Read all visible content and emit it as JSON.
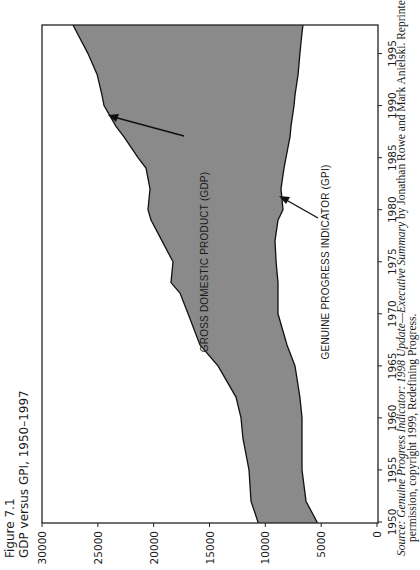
{
  "figure": {
    "number_label": "Figure 7.1",
    "title": "GDP versus GPI, 1950–1997"
  },
  "caption": {
    "line1_prefix": "Source: ",
    "line1_title": "Genuine Progress Indicator: 1998 Update—Executive Summary",
    "line1_rest": " by Jonathan Rowe and Mark Anielski. Reprinted with",
    "line2": "permission, copyright 1999, Redefining Progress."
  },
  "annotations": {
    "gdp": "GROSS DOMESTIC PRODUCT (GDP)",
    "gpi": "GENUINE PROGRESS INDICATOR (GPI)"
  },
  "colors": {
    "fill": "#8a8a8a",
    "line": "#111111",
    "axis": "#222222"
  },
  "chart_data": {
    "type": "area",
    "title": "GDP versus GPI, 1950–1997",
    "xlabel": "",
    "ylabel": "",
    "orientation": "rotated 90° counter-clockwise on page",
    "xlim": [
      1950,
      1997
    ],
    "ylim": [
      0,
      30000
    ],
    "x_ticks": [
      1950,
      1955,
      1960,
      1965,
      1970,
      1975,
      1980,
      1985,
      1990,
      1995
    ],
    "y_ticks": [
      0,
      5000,
      10000,
      15000,
      20000,
      25000,
      30000
    ],
    "grid": false,
    "legend": "none (inline arrow annotations)",
    "fill_between": "region between GDP (upper) and GPI (lower) shaded gray",
    "x": [
      1950,
      1952,
      1955,
      1958,
      1960,
      1962,
      1965,
      1967,
      1970,
      1972,
      1973,
      1975,
      1977,
      1979,
      1980,
      1982,
      1984,
      1985,
      1987,
      1988,
      1990,
      1991,
      1993,
      1995,
      1997
    ],
    "series": [
      {
        "name": "Gross Domestic Product (GDP)",
        "values": [
          10660,
          11280,
          11460,
          12000,
          12180,
          12630,
          14240,
          15850,
          16920,
          17640,
          18450,
          18270,
          19250,
          20240,
          20510,
          20330,
          20690,
          21400,
          22660,
          23370,
          24450,
          24630,
          25070,
          25880,
          26870
        ]
      },
      {
        "name": "Genuine Progress Indicator (GPI)",
        "values": [
          5370,
          6360,
          6720,
          6720,
          6720,
          6900,
          7340,
          8060,
          8870,
          8870,
          8870,
          9040,
          9130,
          8870,
          8420,
          8600,
          8330,
          8150,
          7790,
          7700,
          7430,
          7340,
          7070,
          6900,
          6720
        ]
      }
    ],
    "annotations": [
      {
        "text": "GROSS DOMESTIC PRODUCT (GDP)",
        "arrow_to": [
          1988,
          23370
        ]
      },
      {
        "text": "GENUINE PROGRESS INDICATOR (GPI)",
        "arrow_to": [
          1978,
          9000
        ]
      }
    ]
  }
}
